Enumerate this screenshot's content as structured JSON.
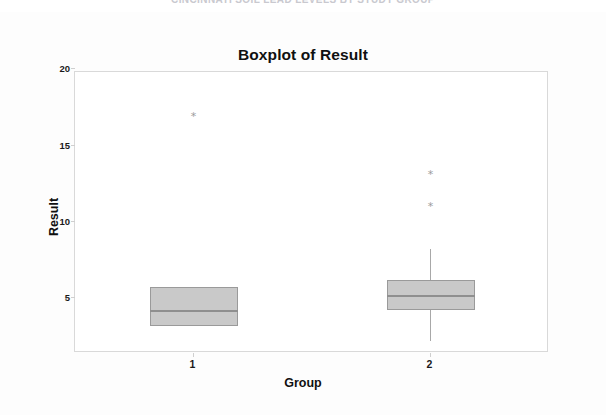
{
  "clipped_header": {
    "text": "CINCINNATI SOIL LEAD LEVELS BY STUDY GROUP"
  },
  "chart": {
    "title": "Boxplot of Result",
    "xlabel": "Group",
    "ylabel": "Result"
  },
  "chart_data": {
    "type": "box",
    "title": "Boxplot of Result",
    "xlabel": "Group",
    "ylabel": "Result",
    "categories": [
      "1",
      "2"
    ],
    "xtick_labels": [
      "1",
      "2"
    ],
    "ytick_labels": [
      "5",
      "10",
      "15",
      "20"
    ],
    "yticks": [
      5,
      10,
      15,
      20
    ],
    "ylim": [
      2.2,
      20.6
    ],
    "grid": false,
    "legend": null,
    "box_fill_color": "#c9c9c9",
    "box_edge_color": "#9a9a9a",
    "median_color": "#8f8f8f",
    "whisker_color": "#a8a8a8",
    "outlier_marker": "*",
    "outlier_color": "#9b9b9b",
    "boxes": [
      {
        "group": "1",
        "q1": 4.0,
        "median": 5.0,
        "q3": 6.5,
        "whisker_low": 4.0,
        "whisker_high": 6.5,
        "outliers": [
          17.7
        ]
      },
      {
        "group": "2",
        "q1": 5.0,
        "median": 6.0,
        "q3": 7.0,
        "whisker_low": 3.0,
        "whisker_high": 9.0,
        "outliers": [
          13.9,
          11.8
        ]
      }
    ]
  }
}
